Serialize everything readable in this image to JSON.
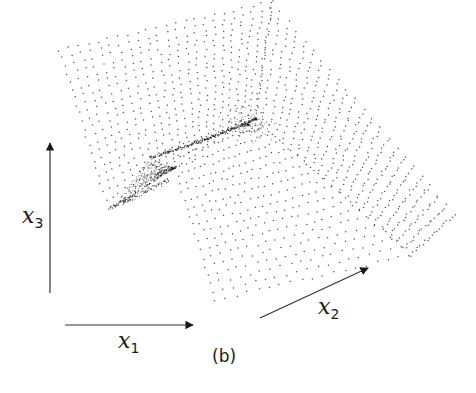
{
  "figure": {
    "caption": "(b)",
    "colors": {
      "ink": "#1a1a1a",
      "background": "#ffffff",
      "axis": "#333333"
    }
  },
  "axes": [
    {
      "id": "x1",
      "symbol": "x",
      "subscript": "1",
      "direction": "horizontal"
    },
    {
      "id": "x2",
      "symbol": "x",
      "subscript": "2",
      "direction": "diagonal"
    },
    {
      "id": "x3",
      "symbol": "x",
      "subscript": "3",
      "direction": "vertical"
    }
  ]
}
